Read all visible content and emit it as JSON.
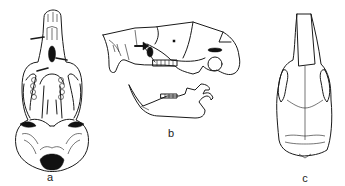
{
  "figure": {
    "panels": [
      {
        "id": "a",
        "label": "a",
        "view": "ventral view of cranium"
      },
      {
        "id": "b",
        "label": "b",
        "view": "lateral view of cranium and mandible"
      },
      {
        "id": "c",
        "label": "c",
        "view": "dorsal view of cranium"
      }
    ]
  },
  "colors": {
    "line": "#1a1a1a",
    "background": "#ffffff"
  }
}
